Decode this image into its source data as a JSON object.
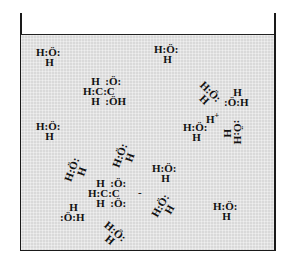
{
  "diagram": {
    "container": "beaker",
    "fill_color": "#d9d9d9",
    "water_molecules": [
      {
        "lines": [
          "H:Ö:",
          " H"
        ],
        "x": 36,
        "y": 47,
        "rotate": 0
      },
      {
        "lines": [
          "H:Ö:",
          " H"
        ],
        "x": 154,
        "y": 44,
        "rotate": 0
      },
      {
        "lines": [
          "H:Ö:",
          " H"
        ],
        "x": 36,
        "y": 121,
        "rotate": 0
      },
      {
        "lines": [
          "H:Ö:",
          " H"
        ],
        "x": 195,
        "y": 85,
        "rotate": 45
      },
      {
        "lines": [
          " H",
          ":Ö:H"
        ],
        "x": 224,
        "y": 87,
        "rotate": 0
      },
      {
        "lines": [
          "H:Ö:",
          " H"
        ],
        "x": 183,
        "y": 122,
        "rotate": 0
      },
      {
        "lines": [
          ":Ö:H",
          " H"
        ],
        "x": 221,
        "y": 122,
        "rotate": 90
      },
      {
        "lines": [
          "H:Ö:",
          " H"
        ],
        "x": 112,
        "y": 147,
        "rotate": -70
      },
      {
        "lines": [
          "H:Ö:",
          " H"
        ],
        "x": 64,
        "y": 161,
        "rotate": -70
      },
      {
        "lines": [
          "H:Ö:",
          " H"
        ],
        "x": 152,
        "y": 163,
        "rotate": 0
      },
      {
        "lines": [
          "H:Ö:",
          " H"
        ],
        "x": 152,
        "y": 198,
        "rotate": -60
      },
      {
        "lines": [
          " H",
          ":Ö:H"
        ],
        "x": 60,
        "y": 202,
        "rotate": 0
      },
      {
        "lines": [
          "H:Ö:",
          " H"
        ],
        "x": 100,
        "y": 225,
        "rotate": 40
      },
      {
        "lines": [
          "H:Ö:",
          " H"
        ],
        "x": 213,
        "y": 201,
        "rotate": 0
      }
    ],
    "acetic_acid": {
      "lines": [
        "   H  :Ö:",
        "H:C:C",
        "   H  :ÖH"
      ],
      "x": 83,
      "y": 76,
      "label": "CH3COOH"
    },
    "acetate_ion": {
      "lines": [
        "   H  :Ö:",
        "H:C:C",
        "   H  :Ö:"
      ],
      "x": 88,
      "y": 178,
      "charge": "-",
      "label": "CH3COO-"
    },
    "hydronium": {
      "text": "H",
      "charge": "+",
      "x": 206,
      "y": 111
    }
  }
}
